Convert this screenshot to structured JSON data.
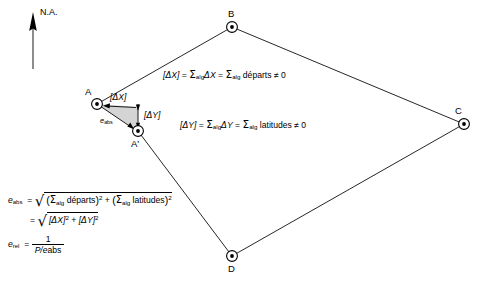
{
  "diagram": {
    "north_arrow": {
      "label": "N.A."
    },
    "stations": [
      {
        "id": "A",
        "label": "A",
        "x": 97,
        "y": 104
      },
      {
        "id": "B",
        "label": "B",
        "x": 232,
        "y": 27
      },
      {
        "id": "C",
        "label": "C",
        "x": 464,
        "y": 124
      },
      {
        "id": "D",
        "label": "D",
        "x": 232,
        "y": 256
      },
      {
        "id": "Ap",
        "label": "A'",
        "x": 138,
        "y": 131
      }
    ],
    "traverse_path": "A -> B -> C -> D -> A'",
    "error_triangle": {
      "fill_color": "#d4d4d4",
      "vertices": [
        [
          97,
          104
        ],
        [
          138,
          107
        ],
        [
          138,
          131
        ]
      ],
      "legs": {
        "dx_label": "[ΔX]",
        "dy_label": "[ΔY]",
        "hypotenuse_label_var": "e",
        "hypotenuse_label_sub": "abs"
      }
    },
    "equations": {
      "dx_line": {
        "lhs": "[ΔX]",
        "text": "[ΔX] = ΣalgΔX = Σalg départs ≠ 0",
        "sum_sub": "alg",
        "term1": "ΔX",
        "term2": "départs",
        "relation": "≠",
        "value": "0"
      },
      "dy_line": {
        "lhs": "[ΔY]",
        "text": "[ΔY] = ΣalgΔY = Σalg latitudes ≠ 0",
        "sum_sub": "alg",
        "term1": "ΔY",
        "term2": "latitudes",
        "relation": "≠",
        "value": "0"
      }
    },
    "formulas": {
      "eabs_var": "e",
      "eabs_sub": "abs",
      "equals": "=",
      "line1": {
        "text": "√( (Σalg départs)² + (Σalg latitudes)² )",
        "sum_sub": "alg",
        "term_a": "départs",
        "term_b": "latitudes",
        "plus": "+",
        "exponent": "2"
      },
      "line2": {
        "text": "√( [ΔX]² + [ΔY]² )",
        "term_a": "[ΔX]",
        "term_b": "[ΔY]",
        "plus": "+",
        "exponent": "2"
      },
      "erel_var": "e",
      "erel_sub": "rel",
      "erel_numerator": "1",
      "erel_denominator_p": "P/e",
      "erel_denominator_sub": "abs"
    },
    "symbols": {
      "sigma": "Σ",
      "delta": "Δ",
      "not_equal": "≠",
      "sqrt": "√"
    },
    "colors": {
      "line": "#000000",
      "shade": "#d4d4d4",
      "background": "#ffffff"
    }
  }
}
